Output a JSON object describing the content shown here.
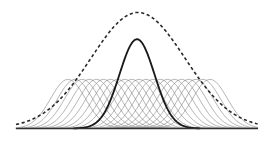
{
  "figure": {
    "width": 276,
    "height": 147,
    "background_color": "#ffffff"
  },
  "axis": {
    "label": "baseline-axis",
    "color": "#2e2e2e",
    "x_start": 16,
    "x_end": 258,
    "y": 128.5,
    "stroke_width": 1.5
  },
  "legend_semantics": {
    "basis_curves": "thin grey Gaussian basis functions",
    "highlight_curve": "bold black Gaussian basis function",
    "envelope_curve": "dashed envelope / sum curve"
  },
  "chart_data": {
    "type": "line",
    "subtitle": "",
    "xlabel": "",
    "ylabel": "",
    "xlim": [
      16,
      258
    ],
    "ylim": [
      0,
      1.35
    ],
    "grid": false,
    "legend_position": "none",
    "baseline_y_px": 128.5,
    "plot_top_px": 8,
    "annotations": [],
    "series": [
      {
        "name": "basis-functions",
        "style": "thin-grey-solid",
        "color": "#7a7a7a",
        "stroke_width": 0.62,
        "count": 21,
        "peak_height": 0.55,
        "sigma_px": 17.5,
        "centers_px": [
          68,
          75.1,
          82.2,
          89.3,
          96.4,
          103.5,
          110.6,
          117.7,
          124.8,
          131.9,
          139,
          146.1,
          153.2,
          160.3,
          167.4,
          174.5,
          181.6,
          188.7,
          195.8,
          202.9,
          210
        ]
      },
      {
        "name": "highlighted-basis-function",
        "style": "bold-black-solid",
        "color": "#1a1a1a",
        "stroke_width": 1.85,
        "center_px": 137,
        "peak_height": 1.0,
        "peak_y_px": 39,
        "sigma_px": 17.5
      },
      {
        "name": "envelope-sum",
        "style": "black-dashed",
        "color": "#2b2b2b",
        "stroke_width": 1.6,
        "dash_pattern": "3.2 2.6",
        "center_px": 138,
        "peak_height": 1.3,
        "peak_y_px": 10,
        "sigma_px": 47
      }
    ]
  }
}
